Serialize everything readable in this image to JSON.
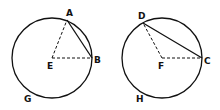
{
  "diagram": {
    "left_circle": {
      "labels": {
        "A": "A",
        "B": "B",
        "E": "E",
        "G": "G"
      }
    },
    "right_circle": {
      "labels": {
        "D": "D",
        "C": "C",
        "F": "F",
        "H": "H"
      }
    },
    "colors": {
      "stroke": "#111111",
      "background": "#ffffff"
    }
  }
}
